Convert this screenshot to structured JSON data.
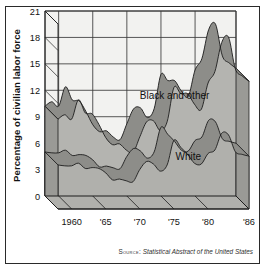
{
  "figure": {
    "ylabel": "Percentage of civilian labor force",
    "source_label": "Source:",
    "source_title": "Statistical Abstract of the United States"
  },
  "colors": {
    "page_background": "#ffffff",
    "frame_border": "#2a2a2a",
    "plot_background": "#f2f2f0",
    "band_fill": "#b4b4b0",
    "ribbon_fill": "#8d8d89",
    "floor_fill": "#b0b0ac",
    "side_fill": "#9a9a96",
    "grid_line": "#3a3a3a",
    "outline": "#1d1d1d",
    "text": "#121212"
  },
  "chart_data": {
    "type": "area",
    "title": "",
    "xlabel": "",
    "ylabel": "Percentage of civilian labor force",
    "xlim": [
      1958,
      1986
    ],
    "ylim": [
      0,
      21
    ],
    "yticks": [
      0,
      3,
      6,
      9,
      12,
      15,
      18,
      21
    ],
    "ytick_labels": [
      "0",
      "3",
      "6",
      "9",
      "12",
      "15",
      "18",
      "21"
    ],
    "xticks": [
      1960,
      1965,
      1970,
      1975,
      1980,
      1986
    ],
    "xtick_labels": [
      "1960",
      "'65",
      "'70",
      "'75",
      "'80",
      "'86"
    ],
    "grid": true,
    "legend": "inline-annotations",
    "annotations": [
      {
        "text": "Black and other",
        "x": 1977.0,
        "y": 11.0
      },
      {
        "text": "White",
        "x": 1979.0,
        "y": 4.1
      }
    ],
    "x": [
      1958,
      1959,
      1960,
      1961,
      1962,
      1963,
      1964,
      1965,
      1966,
      1967,
      1968,
      1969,
      1970,
      1971,
      1972,
      1973,
      1974,
      1975,
      1976,
      1977,
      1978,
      1979,
      1980,
      1981,
      1982,
      1983,
      1984,
      1985,
      1986
    ],
    "series": [
      {
        "name": "Black and other",
        "values": [
          10.2,
          10.7,
          10.2,
          12.4,
          10.9,
          10.8,
          9.6,
          8.1,
          7.3,
          7.4,
          6.7,
          6.4,
          8.2,
          9.9,
          10.0,
          8.9,
          9.9,
          13.8,
          13.1,
          13.1,
          11.9,
          11.3,
          14.3,
          15.6,
          18.9,
          19.5,
          15.9,
          15.1,
          14.5
        ]
      },
      {
        "name": "White",
        "values": [
          5.0,
          4.9,
          4.9,
          5.2,
          4.6,
          4.7,
          4.6,
          4.1,
          3.3,
          3.4,
          3.2,
          3.1,
          4.5,
          5.4,
          5.1,
          4.3,
          5.0,
          7.8,
          7.0,
          6.2,
          5.2,
          5.1,
          6.3,
          6.7,
          8.6,
          8.4,
          6.5,
          6.2,
          6.0
        ]
      }
    ]
  }
}
